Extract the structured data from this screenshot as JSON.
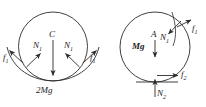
{
  "figure": {
    "stroke_color": "#2b2b2b",
    "text_color": "#1a1a1a",
    "background": "#ffffff"
  },
  "left_body": {
    "name": "left-circle-body",
    "center_label": "C",
    "weight_label": "2Mg",
    "normal_left_label": "N",
    "normal_left_sub": "1",
    "normal_right_label": "N",
    "normal_right_sub": "1",
    "friction_left_label": "f",
    "friction_left_sub": "1",
    "friction_right_label": "f",
    "friction_right_sub": "1"
  },
  "right_body": {
    "name": "right-circle-body",
    "center_label": "A",
    "weight_label": "Mg",
    "normal_upper_label": "N",
    "normal_upper_sub": "1",
    "friction_upper_label": "f",
    "friction_upper_sub": "1",
    "friction_bottom_label": "f",
    "friction_bottom_sub": "2",
    "normal_bottom_label": "N",
    "normal_bottom_sub": "2"
  }
}
